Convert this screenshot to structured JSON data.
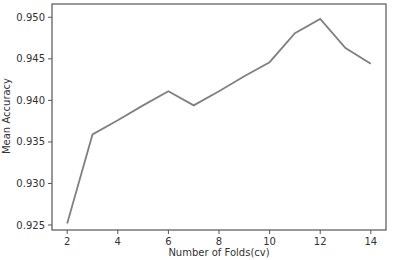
{
  "chart_data": {
    "type": "line",
    "title": "",
    "xlabel": "Number of Folds(cv)",
    "ylabel": "Mean Accuracy",
    "x": [
      2,
      3,
      4,
      5,
      6,
      7,
      8,
      9,
      10,
      11,
      12,
      13,
      14
    ],
    "series": [
      {
        "name": "Mean Accuracy",
        "color": "#808080",
        "values": [
          0.9252,
          0.9359,
          0.9376,
          0.9394,
          0.9411,
          0.9394,
          0.9411,
          0.9429,
          0.9446,
          0.9481,
          0.9498,
          0.9463,
          0.9444
        ]
      }
    ],
    "xticks": [
      2,
      4,
      6,
      8,
      10,
      12,
      14
    ],
    "xtick_labels": [
      "2",
      "4",
      "6",
      "8",
      "10",
      "12",
      "14"
    ],
    "yticks": [
      0.925,
      0.93,
      0.935,
      0.94,
      0.945,
      0.95
    ],
    "ytick_labels": [
      "0.925",
      "0.930",
      "0.935",
      "0.940",
      "0.945",
      "0.950"
    ],
    "xlim": [
      1.4,
      14.6
    ],
    "ylim": [
      0.9244,
      0.9516
    ],
    "grid": false,
    "legend": null
  },
  "colors": {
    "line": "#808080",
    "axes": "#555555",
    "text": "#333333"
  }
}
